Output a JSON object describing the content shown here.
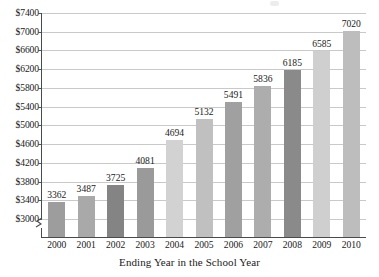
{
  "chart_data": {
    "type": "bar",
    "title": "",
    "xlabel": "Ending Year in the School Year",
    "ylabel": "",
    "categories": [
      "2000",
      "2001",
      "2002",
      "2003",
      "2004",
      "2005",
      "2006",
      "2007",
      "2008",
      "2009",
      "2010"
    ],
    "values": [
      3362,
      3487,
      3725,
      4081,
      4694,
      5132,
      5491,
      5836,
      6185,
      6585,
      7020
    ],
    "bar_labels": [
      "3362",
      "3487",
      "3725",
      "4081",
      "4694",
      "5132",
      "5491",
      "5836",
      "6185",
      "6585",
      "7020"
    ],
    "bar_colors": [
      "#9d9d9d",
      "#a9a9a9",
      "#848484",
      "#9a9a9a",
      "#d2d2d2",
      "#c0c0c0",
      "#a0a0a0",
      "#adadad",
      "#8a8a8a",
      "#cfcfcf",
      "#bdbdbd"
    ],
    "ylim": [
      3000,
      7400
    ],
    "y_tick_step": 400,
    "y_tick_labels": [
      "$7400",
      "$7000",
      "$6600",
      "$6200",
      "$5800",
      "$5400",
      "$5000",
      "$4600",
      "$4200",
      "$3800",
      "$3400",
      "$3000"
    ],
    "y_tick_values": [
      7400,
      7000,
      6600,
      6200,
      5800,
      5400,
      5000,
      4600,
      4200,
      3800,
      3400,
      3000
    ],
    "grid": true,
    "grid_color": "#c9c9c9",
    "axis_color": "#4a4a4a",
    "axis_break": true,
    "legend": "none"
  }
}
